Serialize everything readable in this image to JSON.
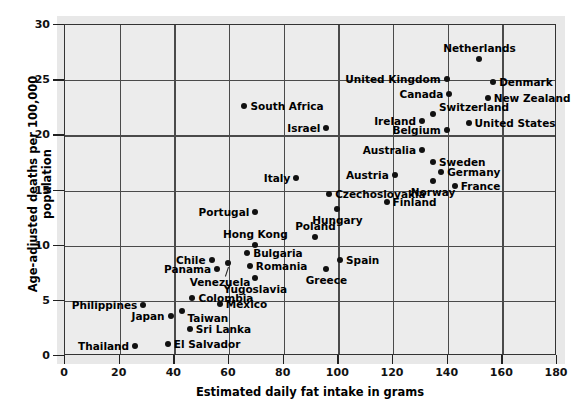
{
  "chart_data": {
    "type": "scatter",
    "title": "",
    "xlabel": "Estimated daily fat intake in grams",
    "ylabel": "Age-adjusted deaths per 100,000 population",
    "xlim": [
      0,
      180
    ],
    "ylim": [
      0,
      30
    ],
    "xticks": [
      0,
      20,
      40,
      60,
      80,
      100,
      120,
      140,
      160,
      180
    ],
    "yticks": [
      0,
      5,
      10,
      15,
      20,
      25,
      30
    ],
    "grid": true,
    "legend": "none",
    "point_color": "#111111",
    "plot_background": "#ececec",
    "points": [
      {
        "label": "Netherlands",
        "x": 152,
        "y": 26.8,
        "pos": "t"
      },
      {
        "label": "Denmark",
        "x": 157,
        "y": 24.7,
        "pos": "r"
      },
      {
        "label": "United Kingdom",
        "x": 140,
        "y": 25.0,
        "pos": "l"
      },
      {
        "label": "Canada",
        "x": 141,
        "y": 23.7,
        "pos": "l"
      },
      {
        "label": "New Zealand",
        "x": 155,
        "y": 23.3,
        "pos": "r"
      },
      {
        "label": "South Africa",
        "x": 66,
        "y": 22.6,
        "pos": "r"
      },
      {
        "label": "Switzerland",
        "x": 135,
        "y": 21.8,
        "pos": "tr"
      },
      {
        "label": "Ireland",
        "x": 131,
        "y": 21.2,
        "pos": "l"
      },
      {
        "label": "United States",
        "x": 148,
        "y": 21.0,
        "pos": "r"
      },
      {
        "label": "Israel",
        "x": 96,
        "y": 20.6,
        "pos": "l"
      },
      {
        "label": "Belgium",
        "x": 140,
        "y": 20.4,
        "pos": "l"
      },
      {
        "label": "Australia",
        "x": 131,
        "y": 18.6,
        "pos": "l"
      },
      {
        "label": "Sweden",
        "x": 135,
        "y": 17.5,
        "pos": "r"
      },
      {
        "label": "Germany",
        "x": 138,
        "y": 16.6,
        "pos": "r"
      },
      {
        "label": "Austria",
        "x": 121,
        "y": 16.3,
        "pos": "l"
      },
      {
        "label": "Norway",
        "x": 135,
        "y": 15.8,
        "pos": "b"
      },
      {
        "label": "France",
        "x": 143,
        "y": 15.3,
        "pos": "r"
      },
      {
        "label": "Italy",
        "x": 85,
        "y": 16.0,
        "pos": "l"
      },
      {
        "label": "Czechoslovakia",
        "x": 97,
        "y": 14.6,
        "pos": "r"
      },
      {
        "label": "Finland",
        "x": 118,
        "y": 13.9,
        "pos": "r"
      },
      {
        "label": "Hungary",
        "x": 100,
        "y": 13.2,
        "pos": "b"
      },
      {
        "label": "Portugal",
        "x": 70,
        "y": 13.0,
        "pos": "l"
      },
      {
        "label": "Poland",
        "x": 92,
        "y": 10.7,
        "pos": "t"
      },
      {
        "label": "Hong Kong",
        "x": 70,
        "y": 10.0,
        "pos": "t"
      },
      {
        "label": "Bulgaria",
        "x": 67,
        "y": 9.2,
        "pos": "r"
      },
      {
        "label": "Chile",
        "x": 54,
        "y": 8.6,
        "pos": "l"
      },
      {
        "label": "Spain",
        "x": 101,
        "y": 8.6,
        "pos": "r"
      },
      {
        "label": "Romania",
        "x": 68,
        "y": 8.1,
        "pos": "r"
      },
      {
        "label": "Panama",
        "x": 56,
        "y": 7.8,
        "pos": "l"
      },
      {
        "label": "Greece",
        "x": 96,
        "y": 7.8,
        "pos": "b"
      },
      {
        "label": "Venezuela",
        "x": 60,
        "y": 8.3,
        "pos": "leader-b"
      },
      {
        "label": "Yugoslavia",
        "x": 70,
        "y": 7.0,
        "pos": "b"
      },
      {
        "label": "Colombia",
        "x": 47,
        "y": 5.2,
        "pos": "r"
      },
      {
        "label": "Mexico",
        "x": 57,
        "y": 4.6,
        "pos": "r"
      },
      {
        "label": "Philippines",
        "x": 29,
        "y": 4.5,
        "pos": "l"
      },
      {
        "label": "Taiwan",
        "x": 43,
        "y": 4.0,
        "pos": "br"
      },
      {
        "label": "Japan",
        "x": 39,
        "y": 3.5,
        "pos": "l"
      },
      {
        "label": "Sri Lanka",
        "x": 46,
        "y": 2.4,
        "pos": "r"
      },
      {
        "label": "El Salvador",
        "x": 38,
        "y": 1.0,
        "pos": "r"
      },
      {
        "label": "Thailand",
        "x": 26,
        "y": 0.8,
        "pos": "l"
      }
    ]
  }
}
